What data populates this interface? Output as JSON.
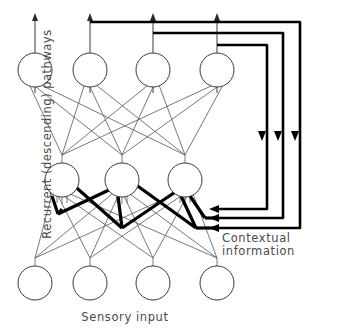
{
  "figure": {
    "background_color": "#ffffff",
    "line_color": "#555555",
    "thick_line_color": "#000000",
    "node_stroke_color": "#3a3a3a"
  },
  "labels": {
    "sensory_input": "Sensory  input",
    "contextual_line1": "Contextual",
    "contextual_line2": "information",
    "recurrent_pathways": "Recurrent  (descending)  pathways"
  },
  "layers": {
    "output": {
      "name": "output-layer",
      "count": 4,
      "cy": 70,
      "r": 17,
      "cx": [
        35,
        90,
        153,
        217
      ]
    },
    "hidden": {
      "name": "hidden-layer",
      "count": 3,
      "cy": 180,
      "r": 17,
      "cx": [
        62,
        122,
        185
      ]
    },
    "input": {
      "name": "input-layer",
      "count": 4,
      "cy": 283,
      "r": 17,
      "cx": [
        35,
        90,
        153,
        217
      ]
    }
  },
  "recurrent_loops": {
    "count": 3,
    "right_x": [
      300,
      283,
      267
    ],
    "top_y": [
      22,
      33,
      45
    ],
    "bottom_y": [
      228,
      218,
      209
    ],
    "source_x": [
      90,
      153,
      217
    ],
    "descend_arrow_x": [
      295,
      278,
      262
    ],
    "descend_arrow_y": 136
  },
  "arrows": {
    "output_up_tip_y": 14,
    "output_up_x": [
      35,
      90,
      153,
      217
    ],
    "contextual_in_tips_x": 213,
    "contextual_in_y": [
      209,
      218,
      228
    ]
  }
}
